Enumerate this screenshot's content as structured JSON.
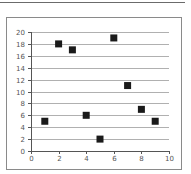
{
  "chart_data": {
    "type": "scatter",
    "title": "",
    "xlabel": "",
    "ylabel": "",
    "xlim": [
      0,
      10
    ],
    "ylim": [
      0,
      20
    ],
    "grid": {
      "horizontal": true,
      "vertical": false
    },
    "legend": null,
    "x_ticks": [
      "0",
      "2",
      "4",
      "6",
      "8",
      "10"
    ],
    "y_ticks": [
      "0",
      "2",
      "4",
      "6",
      "8",
      "10",
      "12",
      "14",
      "16",
      "18",
      "20"
    ],
    "series": [
      {
        "name": "Series 1",
        "marker": "square",
        "color": "#1a1a1a",
        "points": [
          {
            "x": 1,
            "y": 5
          },
          {
            "x": 2,
            "y": 18
          },
          {
            "x": 3,
            "y": 17
          },
          {
            "x": 4,
            "y": 6
          },
          {
            "x": 5,
            "y": 2
          },
          {
            "x": 6,
            "y": 19
          },
          {
            "x": 7,
            "y": 11
          },
          {
            "x": 8,
            "y": 7
          },
          {
            "x": 9,
            "y": 5
          }
        ]
      }
    ]
  },
  "colors": {
    "gridline": "#b0b0b0",
    "axis": "#555555",
    "marker": "#1a1a1a",
    "border": "#8a8a8a"
  }
}
